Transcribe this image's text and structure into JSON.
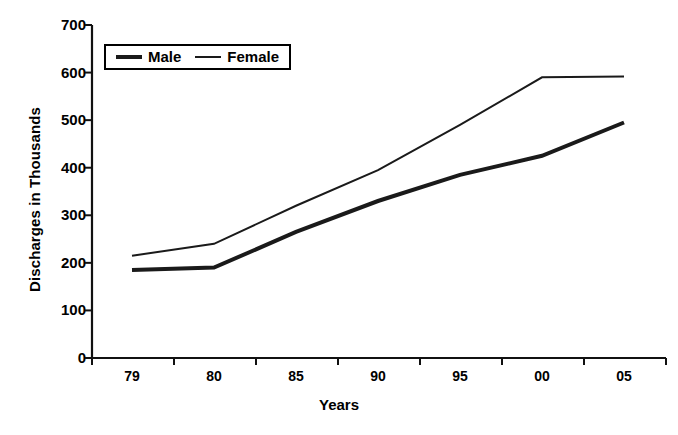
{
  "chart_data": {
    "type": "line",
    "title": "",
    "subtitle": "",
    "xlabel": "Years",
    "ylabel": "Discharges in Thousands",
    "categories": [
      "79",
      "80",
      "85",
      "90",
      "95",
      "00",
      "05"
    ],
    "x_tick_labels": [
      "79",
      "80",
      "85",
      "90",
      "95",
      "00",
      "05"
    ],
    "y_tick_labels": [
      "0",
      "100",
      "200",
      "300",
      "400",
      "500",
      "600",
      "700"
    ],
    "y_ticks": [
      0,
      100,
      200,
      300,
      400,
      500,
      600,
      700
    ],
    "ylim": [
      0,
      700
    ],
    "grid": false,
    "legend_position": "top-left",
    "series": [
      {
        "name": "Male",
        "color": "#1a1a1a",
        "line_width": 4,
        "values": [
          185,
          190,
          265,
          330,
          385,
          425,
          495
        ]
      },
      {
        "name": "Female",
        "color": "#1a1a1a",
        "line_width": 2,
        "values": [
          215,
          240,
          320,
          395,
          490,
          590,
          592
        ]
      }
    ],
    "annotations": []
  },
  "legend": {
    "items": [
      {
        "label": "Male",
        "swatch": "thick-line-icon"
      },
      {
        "label": "Female",
        "swatch": "thin-line-icon"
      }
    ]
  },
  "axes": {
    "y_axis_title": "Discharges in Thousands",
    "x_axis_title": "Years"
  }
}
